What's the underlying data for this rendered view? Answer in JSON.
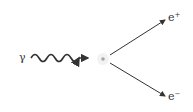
{
  "diagram": {
    "incoming": {
      "label": "γ",
      "type": "photon"
    },
    "vertex": {
      "type": "nucleus"
    },
    "outgoing": [
      {
        "label": "e",
        "charge": "+",
        "type": "positron"
      },
      {
        "label": "e",
        "charge": "−",
        "type": "electron"
      }
    ],
    "colors": {
      "line": "#333333",
      "nucleus": "#999999",
      "background": "#ffffff"
    }
  }
}
